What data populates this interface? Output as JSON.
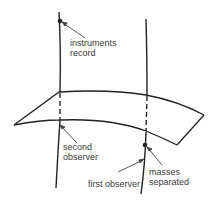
{
  "diagram": {
    "type": "spacetime-diagram",
    "labels": {
      "instruments_record_1": "instruments",
      "instruments_record_2": "record",
      "second_observer_1": "second",
      "second_observer_2": "observer",
      "first_observer": "first observer",
      "masses_separated_1": "masses",
      "masses_separated_2": "separated"
    },
    "elements": [
      {
        "name": "second-observer-worldline",
        "kind": "line"
      },
      {
        "name": "first-observer-worldline",
        "kind": "line"
      },
      {
        "name": "spacelike-surface",
        "kind": "sheet"
      },
      {
        "name": "event-instruments-record",
        "kind": "point"
      },
      {
        "name": "event-masses-separated",
        "kind": "point"
      }
    ],
    "colors": {
      "stroke": "#222222",
      "text": "#3a3a3a",
      "background": "#ffffff"
    }
  }
}
